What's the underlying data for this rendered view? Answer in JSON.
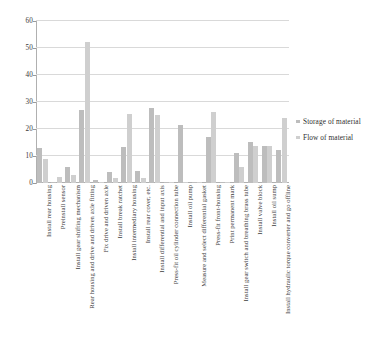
{
  "chart_data": {
    "type": "bar",
    "title": "",
    "subtitle": "",
    "xlabel": "",
    "ylabel": "",
    "ylim": [
      0,
      60
    ],
    "y_ticks": [
      0,
      10,
      20,
      30,
      40,
      50,
      60
    ],
    "grid": true,
    "legend_position": "right",
    "orientation": "vertical",
    "grouping": "grouped",
    "categories": [
      "Install rear housing",
      "Preinstall sensor",
      "Install gear shifting mechanism",
      "Rear housing and drive and driven axle fitting",
      "Fix drive and driven axle",
      "Install break ratchet",
      "Install intermediary housing",
      "Install rear cover, etc.",
      "Install differential and input axis",
      "Press-fit oil cylinder connection tube",
      "Install oil pump",
      "Measure and select differential gasket",
      "Press-fit front-housing",
      "Print permanent mark",
      "Install gear switch and breathing brass tube",
      "Install valve block",
      "Install oil sump",
      "Install hydraulic torque converter and go offline"
    ],
    "series": [
      {
        "name": "Storage of material",
        "color": "#bdbdbd",
        "values": [
          12.8,
          0.3,
          5.8,
          27.0,
          1.0,
          4.2,
          13.5,
          4.3,
          27.7,
          0.4,
          21.6,
          0.3,
          16.9,
          0.3,
          11.2,
          15.2,
          13.7,
          12.4
        ]
      },
      {
        "name": "Flow of material",
        "color": "#cfcfcf",
        "values": [
          8.8,
          2.2,
          3.0,
          52.3,
          0.5,
          2.0,
          25.5,
          2.0,
          25.1,
          0.3,
          0.2,
          0.2,
          26.2,
          0.3,
          6.0,
          13.6,
          13.6,
          24.2
        ]
      }
    ]
  }
}
